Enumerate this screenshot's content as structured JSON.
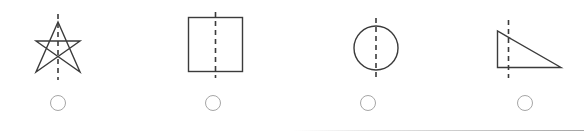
{
  "page": {
    "background_color": "#ffffff",
    "width": 584,
    "height": 133
  },
  "style": {
    "shape_stroke_color": "#3b3b3b",
    "shape_stroke_width": 1.4,
    "dashed_line_color": "#3b3b3b",
    "dashed_line_width": 1.6,
    "dash_pattern": "5,4",
    "radio_border_color": "#a6a6a6",
    "radio_fill_color": "#ffffff",
    "divider_color": "#969696"
  },
  "options": [
    {
      "id": "option-a",
      "shape_name": "five-pointed-star",
      "shape_label": "Five-pointed star with vertical dashed line",
      "symmetry_line": "vertical",
      "selected": false,
      "radio_name": "radio-option-a",
      "left": 6,
      "width": 104
    },
    {
      "id": "option-b",
      "shape_name": "square",
      "shape_label": "Square with vertical dashed line",
      "symmetry_line": "vertical",
      "selected": false,
      "radio_name": "radio-option-b",
      "left": 161,
      "width": 104
    },
    {
      "id": "option-c",
      "shape_name": "circle",
      "shape_label": "Circle with vertical dashed line",
      "symmetry_line": "vertical",
      "selected": false,
      "radio_name": "radio-option-c",
      "left": 316,
      "width": 104
    },
    {
      "id": "option-d",
      "shape_name": "right-triangle",
      "shape_label": "Right triangle with vertical dashed line",
      "symmetry_line": "vertical",
      "selected": false,
      "radio_name": "radio-option-d",
      "left": 473,
      "width": 104
    }
  ],
  "divider": {
    "name": "bottom-divider",
    "visible": true
  }
}
